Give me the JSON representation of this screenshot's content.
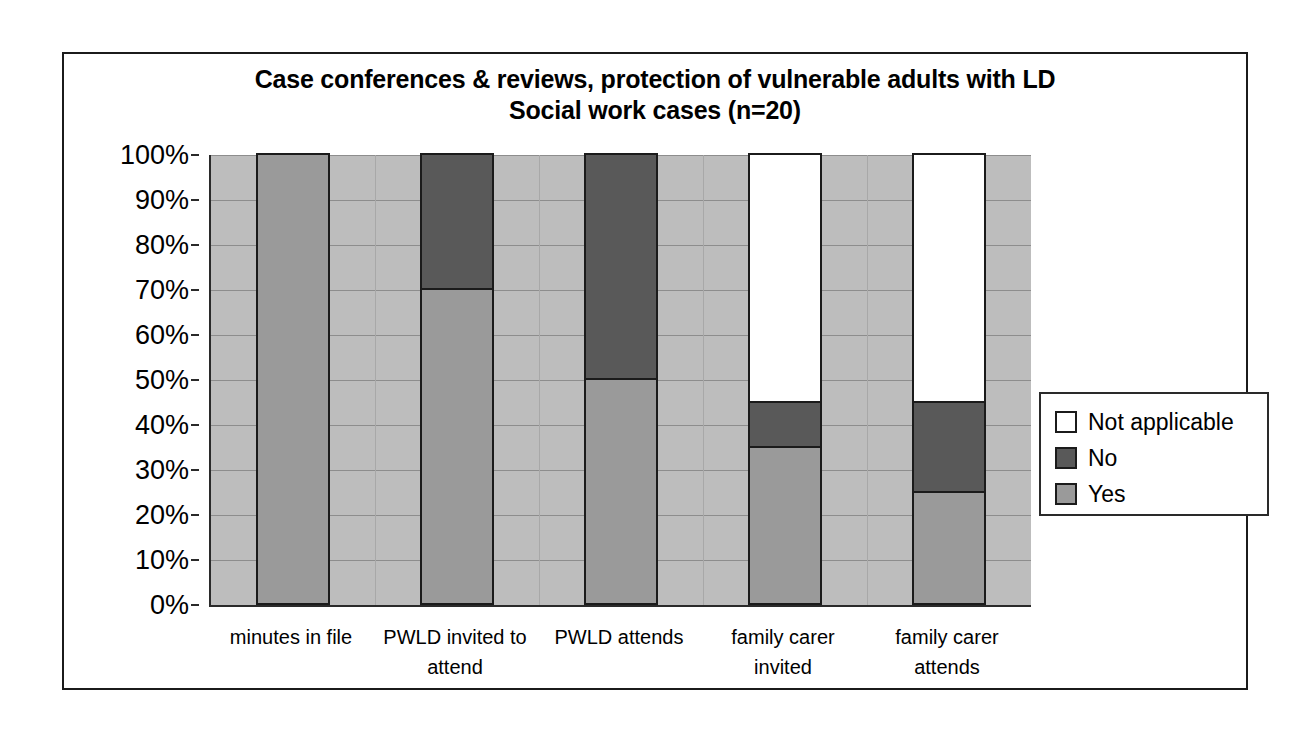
{
  "chart_data": {
    "type": "bar",
    "subtype": "stacked-percent",
    "title": "Case conferences & reviews, protection of vulnerable adults with LD Social work cases (n=20)",
    "title_line1": "Case conferences & reviews, protection of vulnerable adults with LD",
    "title_line2": "Social work cases (n=20)",
    "xlabel": "",
    "ylabel": "",
    "ylim": [
      0,
      100
    ],
    "grid": true,
    "legend_position": "right",
    "categories": [
      "minutes in file",
      "PWLD invited to attend",
      "PWLD attends",
      "family carer invited",
      "family carer attends"
    ],
    "ytick_labels": [
      "100%",
      "90%",
      "80%",
      "70%",
      "60%",
      "50%",
      "40%",
      "30%",
      "20%",
      "10%",
      "0%"
    ],
    "ytick_values": [
      100,
      90,
      80,
      70,
      60,
      50,
      40,
      30,
      20,
      10,
      0
    ],
    "series": [
      {
        "name": "Yes",
        "color": "#9a9a9a",
        "values": [
          100,
          70,
          50,
          35,
          25
        ]
      },
      {
        "name": "No",
        "color": "#595959",
        "values": [
          0,
          30,
          50,
          10,
          20
        ]
      },
      {
        "name": "Not applicable",
        "color": "#ffffff",
        "values": [
          0,
          0,
          0,
          55,
          55
        ]
      }
    ],
    "stack_order_bottom_to_top": [
      "Yes",
      "No",
      "Not applicable"
    ],
    "plot_background": "#bdbdbd",
    "border_color": "#1b1b1b"
  },
  "legend": {
    "items": [
      {
        "label": "Not applicable",
        "color": "#ffffff"
      },
      {
        "label": "No",
        "color": "#595959"
      },
      {
        "label": "Yes",
        "color": "#9a9a9a"
      }
    ]
  },
  "x_axis_labels": [
    {
      "line1": "minutes in file",
      "line2": ""
    },
    {
      "line1": "PWLD invited to",
      "line2": "attend"
    },
    {
      "line1": "PWLD attends",
      "line2": ""
    },
    {
      "line1": "family carer",
      "line2": "invited"
    },
    {
      "line1": "family carer",
      "line2": "attends"
    }
  ]
}
